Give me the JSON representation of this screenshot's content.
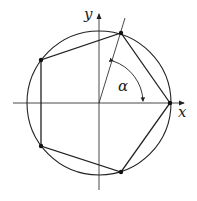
{
  "diagram": {
    "type": "regular pentagon inscribed in circle",
    "labels": {
      "x_axis": "x",
      "y_axis": "y",
      "angle": "α"
    },
    "geometry": {
      "center": [
        99,
        103
      ],
      "radius": 72,
      "vertices": [
        [
          170,
          103
        ],
        [
          121,
          33
        ],
        [
          41,
          60
        ],
        [
          41,
          146
        ],
        [
          121,
          172
        ]
      ]
    },
    "colors": {
      "stroke": "#222222",
      "background": "#ffffff"
    }
  }
}
